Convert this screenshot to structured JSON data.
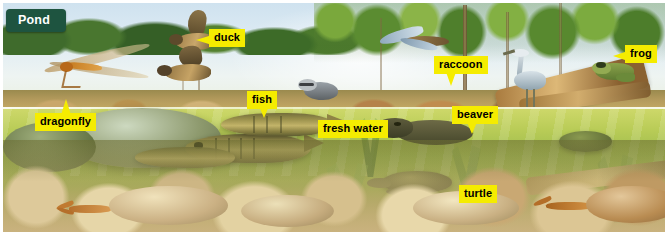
{
  "figure": {
    "title": "Pond",
    "banner_color": "#1e5440",
    "banner_text_color": "#ffffff",
    "label_bg_color": "#f5ec00",
    "label_text_color": "#000000",
    "kind": "illustrated ecosystem cross-section",
    "habitat": "pond"
  },
  "labels": [
    {
      "id": "duck",
      "text": "duck",
      "x": 209,
      "y": 30,
      "pointer": "left"
    },
    {
      "id": "dragonfly",
      "text": "dragonfly",
      "x": 35,
      "y": 113,
      "pointer": "up"
    },
    {
      "id": "fish",
      "text": "fish",
      "x": 247,
      "y": 91,
      "pointer": "down"
    },
    {
      "id": "fresh-water",
      "text": "fresh water",
      "x": 318,
      "y": 120,
      "pointer": "none"
    },
    {
      "id": "raccoon",
      "text": "raccoon",
      "x": 434,
      "y": 56,
      "pointer": "down"
    },
    {
      "id": "beaver",
      "text": "beaver",
      "x": 452,
      "y": 106,
      "pointer": "down"
    },
    {
      "id": "frog",
      "text": "frog",
      "x": 625,
      "y": 46,
      "pointer": "left"
    },
    {
      "id": "turtle",
      "text": "turtle",
      "x": 459,
      "y": 185,
      "pointer": "none"
    }
  ],
  "scene": {
    "sky": "#dfecf4",
    "canopy": "#4c7a2d",
    "bank": "#b39a5c",
    "water": "#a8c251",
    "pond_bottom": "#d6c08d",
    "zones": [
      {
        "name": "sky-and-forest",
        "description": "pale blue sky above a dense green treeline"
      },
      {
        "name": "shoreline",
        "description": "sandy rocky bank along the far edge of the pond"
      },
      {
        "name": "water-surface",
        "description": "bright waterline dividing above and below water"
      },
      {
        "name": "underwater",
        "description": "green fresh water with fish, turtle and beaver"
      },
      {
        "name": "pond-bottom",
        "description": "pale rounded stones, crayfish and water plants"
      }
    ],
    "organisms": [
      "dragonfly",
      "duck",
      "fish",
      "raccoon",
      "beaver",
      "frog",
      "turtle",
      "heron",
      "crayfish"
    ]
  }
}
